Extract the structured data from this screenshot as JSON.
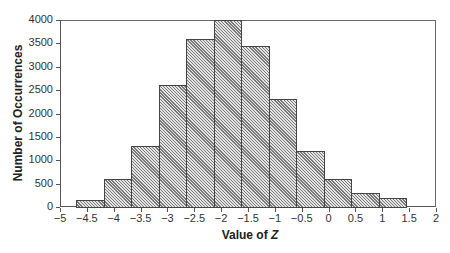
{
  "chart_data": {
    "type": "bar",
    "title": "",
    "xlabel": "Value of Z",
    "xlabel_prefix": "Value of ",
    "xlabel_var": "Z",
    "ylabel": "Number of Occurrences",
    "xlim": [
      -5,
      2
    ],
    "ylim": [
      0,
      4000
    ],
    "grid": false,
    "legend": null,
    "x_ticks": [
      -5,
      -4.5,
      -4,
      -3.5,
      -3,
      -2.5,
      -2,
      -1.5,
      -1,
      -0.5,
      0,
      0.5,
      1,
      1.5,
      2
    ],
    "x_tick_labels": [
      "−5",
      "−4.5",
      "−4",
      "−3.5",
      "−3",
      "−2.5",
      "−2",
      "−1.5",
      "−1",
      "−0.5",
      "0",
      "0.5",
      "1",
      "1.5",
      "2"
    ],
    "y_ticks": [
      0,
      500,
      1000,
      1500,
      2000,
      2500,
      3000,
      3500,
      4000
    ],
    "y_tick_labels": [
      "0",
      "500",
      "1000",
      "1500",
      "2000",
      "2500",
      "3000",
      "3500",
      "4000"
    ],
    "bin_start": -4.7,
    "bin_width": 0.512,
    "categories": [
      "-4.45",
      "-3.93",
      "-3.42",
      "-2.91",
      "-2.40",
      "-1.89",
      "-1.37",
      "-0.86",
      "-0.35",
      "0.16",
      "0.67",
      "1.19"
    ],
    "values": [
      150,
      600,
      1300,
      2600,
      3600,
      4000,
      3450,
      2300,
      1200,
      600,
      300,
      200
    ],
    "style": {
      "fill": "#e4e4e4",
      "hatch": "diagonal",
      "edge": "#444444"
    }
  }
}
